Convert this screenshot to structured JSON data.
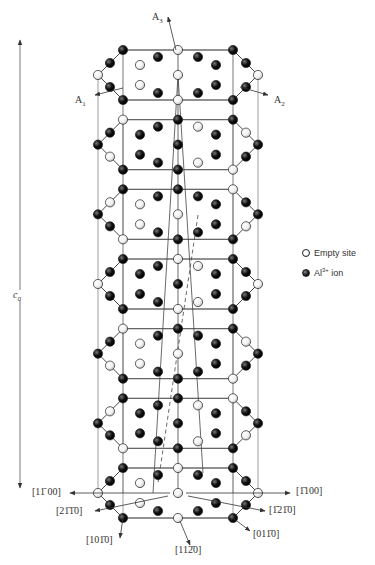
{
  "figure": {
    "type": "crystal-structure-diagram"
  },
  "axes": {
    "top": [
      {
        "id": "A3",
        "label": "A",
        "sub": "3"
      },
      {
        "id": "A1",
        "label": "A",
        "sub": "1"
      },
      {
        "id": "A2",
        "label": "A",
        "sub": "2"
      }
    ],
    "c_axis": {
      "label": "c",
      "sub": "0"
    }
  },
  "directions": [
    {
      "id": "d1",
      "text": "[1̄1̄... ]"
    }
  ],
  "direction_labels": {
    "left_1100": "[11̄ 00]",
    "right_1100": "[1̄100]",
    "left_2110": "[21̄1̄0]",
    "right_1210": "[1̄21̄0]",
    "left_1010": "[101̄0]",
    "bottom_1120": "[112̄0]",
    "right_0110": "[011̄0]"
  },
  "legend": {
    "empty": "Empty site",
    "ion_prefix": "Al",
    "ion_sup": "3+",
    "ion_suffix": " ion"
  },
  "colors": {
    "line": "#555555",
    "ion": "#111111",
    "empty": "#ffffff"
  },
  "layers": {
    "count": 7,
    "top_y": 75,
    "bottom_y": 493,
    "spacing": 69.7
  }
}
